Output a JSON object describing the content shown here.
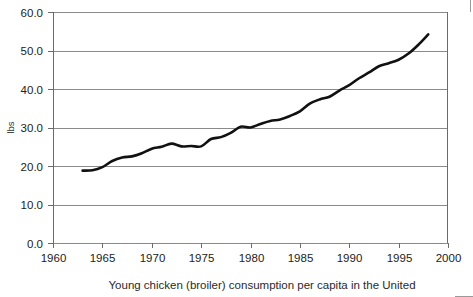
{
  "caption": {
    "text": "Young chicken (broiler) consumption per capita in the United"
  },
  "chart_data": {
    "type": "line",
    "title": "",
    "subtitle": "",
    "xlabel": "",
    "ylabel": "lbs",
    "xlim": [
      1960,
      2000
    ],
    "ylim": [
      0.0,
      60.0
    ],
    "grid": true,
    "grid_axis": "y",
    "legend": false,
    "legend_position": "none",
    "line_color": "#111111",
    "gridline_color": "#8a8a8a",
    "axis_color": "#6b6b6b",
    "x_tick_labels": [
      "1960",
      "1965",
      "1970",
      "1975",
      "1980",
      "1985",
      "1990",
      "1995",
      "2000"
    ],
    "x_ticks": [
      1960,
      1965,
      1970,
      1975,
      1980,
      1985,
      1990,
      1995,
      2000
    ],
    "y_tick_labels": [
      "0.0",
      "10.0",
      "20.0",
      "30.0",
      "40.0",
      "50.0",
      "60.0"
    ],
    "y_ticks": [
      0.0,
      10.0,
      20.0,
      30.0,
      40.0,
      50.0,
      60.0
    ],
    "series": [
      {
        "name": "Young chicken (broiler) consumption per capita",
        "x": [
          1963,
          1964,
          1965,
          1966,
          1967,
          1968,
          1969,
          1970,
          1971,
          1972,
          1973,
          1974,
          1975,
          1976,
          1977,
          1978,
          1979,
          1980,
          1981,
          1982,
          1983,
          1984,
          1985,
          1986,
          1987,
          1988,
          1989,
          1990,
          1991,
          1992,
          1993,
          1994,
          1995,
          1996,
          1997,
          1998
        ],
        "values": [
          18.8,
          18.9,
          19.7,
          21.3,
          22.2,
          22.5,
          23.3,
          24.5,
          25.0,
          25.8,
          25.1,
          25.2,
          25.1,
          27.0,
          27.5,
          28.6,
          30.2,
          30.0,
          30.9,
          31.7,
          32.1,
          33.0,
          34.2,
          36.2,
          37.3,
          38.0,
          39.6,
          41.0,
          42.8,
          44.3,
          45.9,
          46.7,
          47.6,
          49.2,
          51.5,
          54.2
        ]
      }
    ]
  }
}
